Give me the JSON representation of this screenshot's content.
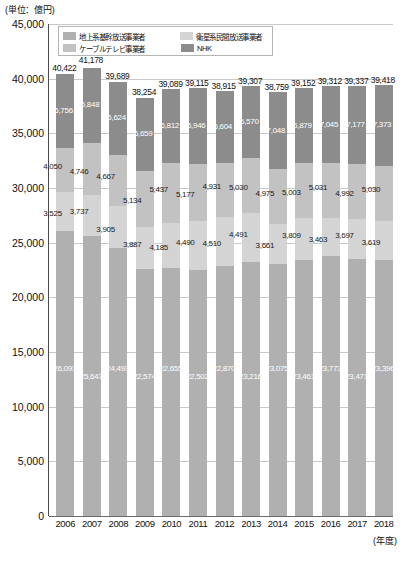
{
  "unit_note": "(単位：億円)",
  "xaxis_unit": "(年度)",
  "legend": {
    "items": [
      {
        "label": "地上系基幹放送事業者",
        "color": "#b0b0b0",
        "key": "terrestrial"
      },
      {
        "label": "衛星系民間放送事業者",
        "color": "#d4d4d4",
        "key": "satellite"
      },
      {
        "label": "ケーブルテレビ事業者",
        "color": "#c2c2c2",
        "key": "cable"
      },
      {
        "label": "NHK",
        "color": "#8c8c8c",
        "key": "nhk"
      }
    ]
  },
  "yaxis": {
    "ticks": [
      "45,000",
      "40,000",
      "35,000",
      "30,000",
      "25,000",
      "20,000",
      "15,000",
      "10,000",
      "5,000",
      "0"
    ],
    "min": 0,
    "max": 45000,
    "step": 5000
  },
  "chart_data": {
    "type": "bar",
    "stacked": true,
    "title": "",
    "xlabel": "(年度)",
    "ylabel": "(単位：億円)",
    "ylim": [
      0,
      45000
    ],
    "ytick_step": 5000,
    "grid": true,
    "legend_position": "top-left-inside",
    "categories": [
      "2006",
      "2007",
      "2008",
      "2009",
      "2010",
      "2011",
      "2012",
      "2013",
      "2014",
      "2015",
      "2016",
      "2017",
      "2018"
    ],
    "series": [
      {
        "name": "地上系基幹放送事業者",
        "color": "#b0b0b0",
        "values": [
          26091,
          25647,
          24493,
          22574,
          22655,
          22502,
          22870,
          23216,
          23075,
          23461,
          23773,
          23471,
          23396
        ]
      },
      {
        "name": "衛星系民間放送事業者",
        "color": "#d4d4d4",
        "values": [
          3525,
          3737,
          3905,
          3887,
          4185,
          4490,
          4510,
          4491,
          3661,
          3809,
          3463,
          3697,
          3619
        ]
      },
      {
        "name": "ケーブルテレビ事業者",
        "color": "#c2c2c2",
        "values": [
          4050,
          4746,
          4667,
          5134,
          5437,
          5177,
          4931,
          5030,
          4975,
          5003,
          5031,
          4992,
          5030
        ]
      },
      {
        "name": "NHK",
        "color": "#8c8c8c",
        "values": [
          6756,
          6848,
          6624,
          6659,
          6812,
          6946,
          6604,
          6570,
          7048,
          6879,
          7045,
          7177,
          7373
        ]
      }
    ],
    "totals": [
      40422,
      41178,
      39689,
      38254,
      39089,
      39115,
      38915,
      39307,
      38759,
      39152,
      39312,
      39337,
      39418
    ],
    "total_labels": [
      "40,422",
      "41,178",
      "39,689",
      "38,254",
      "39,089",
      "39,115",
      "38,915",
      "39,307",
      "38,759",
      "39,152",
      "39,312",
      "39,337",
      "39,418"
    ],
    "segment_labels": {
      "terrestrial": [
        "26,091",
        "25,647",
        "24,493",
        "22,574",
        "22,655",
        "22,502",
        "22,870",
        "23,216",
        "23,075",
        "23,461",
        "23,773",
        "23,471",
        "23,396"
      ],
      "satellite": [
        "3,525",
        "3,737",
        "3,905",
        "3,887",
        "4,185",
        "4,490",
        "4,510",
        "4,491",
        "3,661",
        "3,809",
        "3,463",
        "3,697",
        "3,619"
      ],
      "cable": [
        "4,050",
        "4,746",
        "4,667",
        "5,134",
        "5,437",
        "5,177",
        "4,931",
        "5,030",
        "4,975",
        "5,003",
        "5,031",
        "4,992",
        "5,030"
      ],
      "nhk": [
        "6,756",
        "6,848",
        "6,624",
        "6,659",
        "6,812",
        "6,946",
        "6,604",
        "6,570",
        "7,048",
        "6,879",
        "7,045",
        "7,177",
        "7,373"
      ]
    }
  }
}
